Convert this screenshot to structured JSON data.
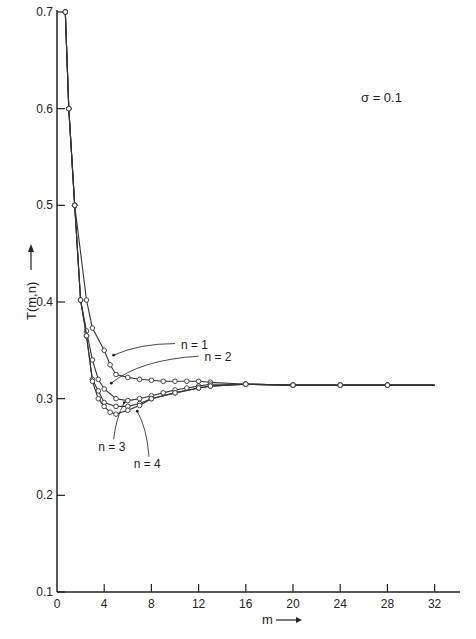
{
  "chart_data": {
    "type": "line",
    "title": "",
    "annotation": "σ = 0.1",
    "xlabel": "m",
    "ylabel": "T(m,n)",
    "xlim": [
      0,
      34
    ],
    "ylim": [
      0.1,
      0.7
    ],
    "x_ticks": [
      0,
      4,
      8,
      12,
      16,
      20,
      24,
      28,
      32
    ],
    "y_ticks": [
      0.1,
      0.2,
      0.3,
      0.4,
      0.5,
      0.6,
      0.7
    ],
    "grid": false,
    "legend": "inline labels",
    "series": [
      {
        "name": "n = 1",
        "points": [
          [
            0.7,
            0.7
          ],
          [
            1,
            0.6
          ],
          [
            1.5,
            0.5
          ],
          [
            2.5,
            0.402
          ],
          [
            3,
            0.373
          ],
          [
            4,
            0.35
          ],
          [
            4.5,
            0.335
          ],
          [
            5,
            0.325
          ],
          [
            6,
            0.322
          ],
          [
            7,
            0.32
          ],
          [
            8,
            0.319
          ],
          [
            9,
            0.318
          ],
          [
            10,
            0.318
          ],
          [
            11,
            0.318
          ],
          [
            12,
            0.318
          ],
          [
            13,
            0.317
          ],
          [
            16,
            0.315
          ],
          [
            20,
            0.314
          ],
          [
            24,
            0.314
          ],
          [
            28,
            0.314
          ],
          [
            32,
            0.314
          ]
        ]
      },
      {
        "name": "n = 2",
        "points": [
          [
            0.7,
            0.7
          ],
          [
            1,
            0.6
          ],
          [
            1.5,
            0.5
          ],
          [
            2,
            0.402
          ],
          [
            2.5,
            0.37
          ],
          [
            3,
            0.34
          ],
          [
            3.5,
            0.32
          ],
          [
            4,
            0.31
          ],
          [
            5,
            0.3
          ],
          [
            6,
            0.298
          ],
          [
            7,
            0.3
          ],
          [
            8,
            0.303
          ],
          [
            9,
            0.306
          ],
          [
            10,
            0.309
          ],
          [
            11,
            0.311
          ],
          [
            12,
            0.313
          ],
          [
            13,
            0.315
          ],
          [
            16,
            0.315
          ],
          [
            20,
            0.314
          ],
          [
            24,
            0.314
          ],
          [
            28,
            0.314
          ],
          [
            32,
            0.314
          ]
        ]
      },
      {
        "name": "n = 3",
        "points": [
          [
            0.7,
            0.7
          ],
          [
            1,
            0.6
          ],
          [
            1.5,
            0.5
          ],
          [
            2,
            0.402
          ],
          [
            2.5,
            0.365
          ],
          [
            3,
            0.32
          ],
          [
            3.5,
            0.308
          ],
          [
            4,
            0.296
          ],
          [
            5,
            0.292
          ],
          [
            6,
            0.292
          ],
          [
            7,
            0.295
          ],
          [
            8,
            0.3
          ],
          [
            10,
            0.306
          ],
          [
            12,
            0.311
          ],
          [
            13,
            0.313
          ],
          [
            16,
            0.315
          ],
          [
            20,
            0.314
          ],
          [
            24,
            0.314
          ],
          [
            28,
            0.314
          ],
          [
            32,
            0.314
          ]
        ]
      },
      {
        "name": "n = 4",
        "points": [
          [
            0.7,
            0.7
          ],
          [
            1,
            0.6
          ],
          [
            1.5,
            0.5
          ],
          [
            2,
            0.402
          ],
          [
            2.5,
            0.365
          ],
          [
            3,
            0.318
          ],
          [
            3.5,
            0.3
          ],
          [
            4,
            0.292
          ],
          [
            4.5,
            0.286
          ],
          [
            5,
            0.284
          ],
          [
            6,
            0.288
          ],
          [
            7,
            0.293
          ],
          [
            8,
            0.3
          ],
          [
            10,
            0.306
          ],
          [
            12,
            0.311
          ],
          [
            13,
            0.313
          ],
          [
            16,
            0.315
          ],
          [
            20,
            0.314
          ],
          [
            24,
            0.314
          ],
          [
            28,
            0.314
          ],
          [
            32,
            0.314
          ]
        ]
      }
    ],
    "labels": [
      {
        "text": "n = 1",
        "x": 10.5,
        "y": 0.356
      },
      {
        "text": "n = 2",
        "x": 12.5,
        "y": 0.343
      },
      {
        "text": "n = 3",
        "x": 3.5,
        "y": 0.25
      },
      {
        "text": "n = 4",
        "x": 6.5,
        "y": 0.232
      }
    ]
  }
}
